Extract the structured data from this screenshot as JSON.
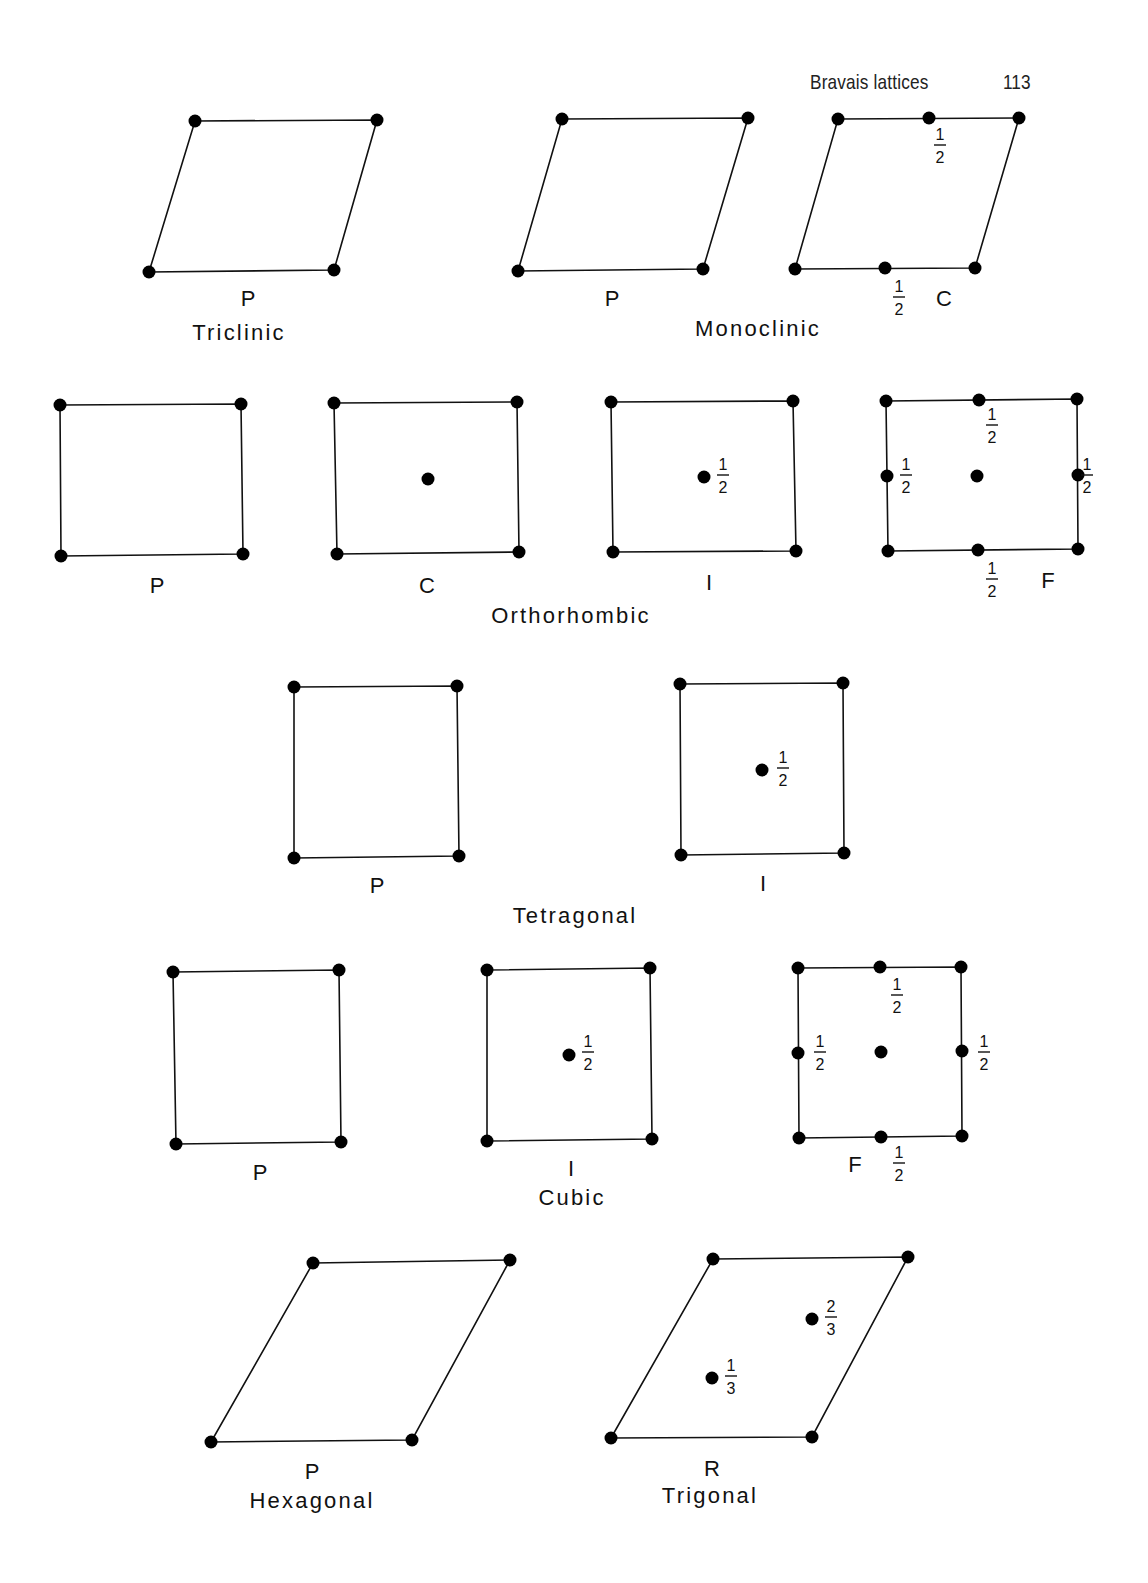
{
  "header": {
    "running_title": "Bravais lattices",
    "page_number": "113"
  },
  "colors": {
    "ink": "#111111",
    "background": "#ffffff"
  },
  "lattices": {
    "triclinic_p": {
      "type": "P",
      "system": "Triclinic"
    },
    "monoclinic_p": {
      "type": "P"
    },
    "monoclinic_c": {
      "type": "C",
      "frac_top": {
        "num": "1",
        "den": "2"
      },
      "frac_bottom": {
        "num": "1",
        "den": "2"
      }
    },
    "monoclinic_system": "Monoclinic",
    "ortho_p": {
      "type": "P"
    },
    "ortho_c": {
      "type": "C"
    },
    "ortho_i": {
      "type": "I",
      "frac_center": {
        "num": "1",
        "den": "2"
      }
    },
    "ortho_f": {
      "type": "F",
      "frac_top": {
        "num": "1",
        "den": "2"
      },
      "frac_left": {
        "num": "1",
        "den": "2"
      },
      "frac_right": {
        "num": "1",
        "den": "2"
      },
      "frac_bottom": {
        "num": "1",
        "den": "2"
      }
    },
    "ortho_system": "Orthorhombic",
    "tetra_p": {
      "type": "P"
    },
    "tetra_i": {
      "type": "I",
      "frac_center": {
        "num": "1",
        "den": "2"
      }
    },
    "tetra_system": "Tetragonal",
    "cubic_p": {
      "type": "P"
    },
    "cubic_i": {
      "type": "I",
      "frac_center": {
        "num": "1",
        "den": "2"
      }
    },
    "cubic_f": {
      "type": "F",
      "frac_top": {
        "num": "1",
        "den": "2"
      },
      "frac_left": {
        "num": "1",
        "den": "2"
      },
      "frac_right": {
        "num": "1",
        "den": "2"
      },
      "frac_bottom": {
        "num": "1",
        "den": "2"
      }
    },
    "cubic_system": "Cubic",
    "hex_p": {
      "type": "P",
      "system": "Hexagonal"
    },
    "trig_r": {
      "type": "R",
      "system": "Trigonal",
      "frac_upper": {
        "num": "2",
        "den": "3"
      },
      "frac_lower": {
        "num": "1",
        "den": "3"
      }
    }
  }
}
